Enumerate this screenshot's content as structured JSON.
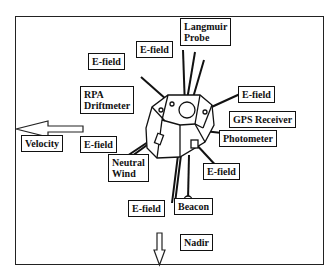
{
  "diagram": {
    "type": "satellite-instrument-layout",
    "labels": {
      "langmuir": "Langmuir\nProbe",
      "efield_top": "E-field",
      "efield_left": "E-field",
      "efield_right": "E-field",
      "rpa": "RPA\nDriftmeter",
      "gps": "GPS Receiver",
      "photometer": "Photometer",
      "velocity": "Velocity",
      "efield_midleft": "E-field",
      "neutral_wind": "Neutral\nWind",
      "efield_lowright": "E-field",
      "efield_bottom": "E-field",
      "beacon": "Beacon",
      "nadir": "Nadir"
    },
    "arrows": {
      "velocity": "left",
      "nadir": "down"
    }
  }
}
